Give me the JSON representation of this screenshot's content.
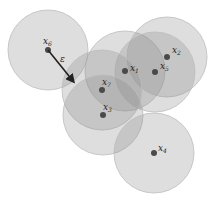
{
  "diagram": {
    "title": "",
    "radius": 40,
    "colors": {
      "circle_fill": "#8a8a8a",
      "circle_fill_opacity": 0.28,
      "circle_stroke": "#bdbdbd",
      "point": "#4a4a4a",
      "arrow": "#222222"
    },
    "points": [
      {
        "id": "x6",
        "base": "x",
        "sub": "6",
        "cx": 48,
        "cy": 50,
        "lx": 43,
        "ly": 44
      },
      {
        "id": "x1",
        "base": "x",
        "sub": "1",
        "cx": 125,
        "cy": 71,
        "lx": 130,
        "ly": 71
      },
      {
        "id": "x2",
        "base": "x",
        "sub": "2",
        "cx": 167,
        "cy": 57,
        "lx": 172,
        "ly": 53
      },
      {
        "id": "x5",
        "base": "x",
        "sub": "5",
        "cx": 155,
        "cy": 72,
        "lx": 160,
        "ly": 69
      },
      {
        "id": "x7",
        "base": "x",
        "sub": "7",
        "cx": 102,
        "cy": 90,
        "lx": 102,
        "ly": 85
      },
      {
        "id": "x3",
        "base": "x",
        "sub": "3",
        "cx": 103,
        "cy": 115,
        "lx": 103,
        "ly": 110
      },
      {
        "id": "x4",
        "base": "x",
        "sub": "4",
        "cx": 154,
        "cy": 153,
        "lx": 158,
        "ly": 151
      }
    ],
    "epsilon": {
      "label": "ε",
      "x1": 48,
      "y1": 50,
      "x2": 73,
      "y2": 81,
      "lx": 60,
      "ly": 62
    }
  }
}
